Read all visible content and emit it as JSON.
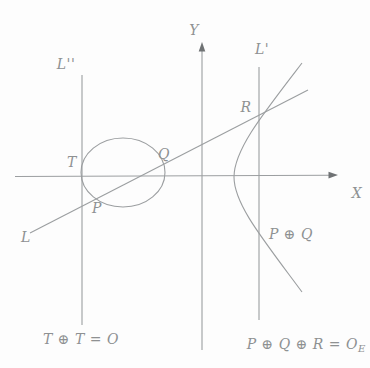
{
  "figure": {
    "type": "elliptic-curve-group-law-diagram",
    "colors": {
      "background": "#fdfdfd",
      "stroke": "#9b9ea0",
      "arrow": "#6f7274",
      "label": "#8e9192"
    },
    "axes": {
      "x_label": "X",
      "y_label": "Y"
    },
    "lines": {
      "secant_label": "L",
      "vertical_right_label": "L'",
      "vertical_left_label": "L''"
    },
    "points": {
      "t_label": "T",
      "p_label": "P",
      "q_label": "Q",
      "r_label": "R",
      "sum_label": "P ⊕ Q"
    },
    "captions": {
      "left_equation": "T ⊕ T = O",
      "right_equation_main": "P ⊕ Q ⊕ R = O",
      "right_equation_sub": "E"
    }
  }
}
